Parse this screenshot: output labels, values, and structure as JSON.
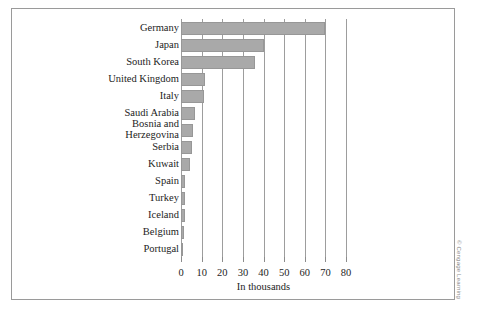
{
  "figure": {
    "credit": "© Cengage Learning"
  },
  "chart_data": {
    "type": "bar",
    "orientation": "horizontal",
    "title": "",
    "subtitle": "",
    "xlabel": "In thousands",
    "ylabel": "",
    "xlim": [
      0,
      80
    ],
    "xticks": [
      0,
      10,
      20,
      30,
      40,
      50,
      60,
      70,
      80
    ],
    "xtick_labels": [
      "0",
      "10",
      "20",
      "30",
      "40",
      "50",
      "60",
      "70",
      "80"
    ],
    "grid": "vertical",
    "legend": null,
    "bar_color": "#a9a9a9",
    "bar_edge_color": "#979797",
    "categories": [
      "Germany",
      "Japan",
      "South Korea",
      "United Kingdom",
      "Italy",
      "Saudi Arabia",
      "Bosnia and\nHerzegovina",
      "Serbia",
      "Kuwait",
      "Spain",
      "Turkey",
      "Iceland",
      "Belgium",
      "Portugal"
    ],
    "values": [
      70,
      40,
      36,
      11.5,
      11,
      7,
      6,
      5.5,
      4.5,
      2,
      2,
      1.8,
      1.6,
      1.2
    ]
  }
}
